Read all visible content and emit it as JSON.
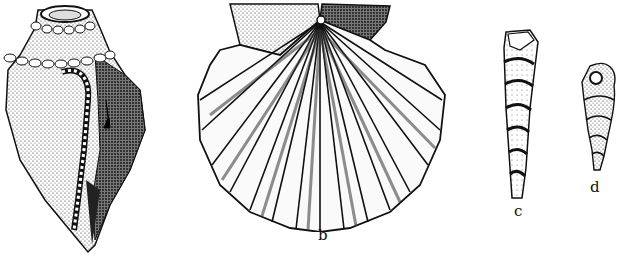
{
  "plate": {
    "description": "Stippled pen illustration of four fossil shells",
    "background": "#ffffff",
    "ink": "#111111",
    "figures": [
      {
        "id": "a",
        "label": "",
        "subject": "knobbed gastropod (conch-like shell with beaded shoulders and apertural lip)"
      },
      {
        "id": "b",
        "label": "b",
        "subject": "scallop (pectinid bivalve with radial ribs and ears)"
      },
      {
        "id": "c",
        "label": "c",
        "subject": "high-spired turritelliform gastropod"
      },
      {
        "id": "d",
        "label": "d",
        "subject": "small spired gastropod with round aperture"
      }
    ]
  }
}
